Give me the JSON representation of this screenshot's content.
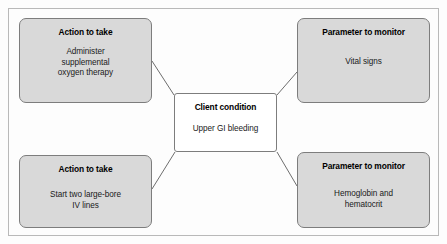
{
  "diagram": {
    "type": "concept-map",
    "center_node": {
      "title": "Client condition",
      "body": "Upper GI bleeding"
    },
    "satellite_nodes": [
      {
        "id": "action-oxygen",
        "position": "top-left",
        "title": "Action to take",
        "body": "Administer\nsupplemental\noxygen therapy"
      },
      {
        "id": "param-vitals",
        "position": "top-right",
        "title": "Parameter to monitor",
        "body": "Vital signs"
      },
      {
        "id": "action-iv",
        "position": "bottom-left",
        "title": "Action to take",
        "body": "Start two large-bore\nIV lines"
      },
      {
        "id": "param-hgb",
        "position": "bottom-right",
        "title": "Parameter to monitor",
        "body": "Hemoglobin and\nhematocrit"
      }
    ],
    "colors": {
      "satellite_fill": "#d9d9d9",
      "center_fill": "#ffffff",
      "border": "#7d7d7d",
      "frame": "#b9b9b9",
      "connector": "#6e6e6e",
      "page_background": "#fdfdfd",
      "text": "#000000"
    }
  }
}
